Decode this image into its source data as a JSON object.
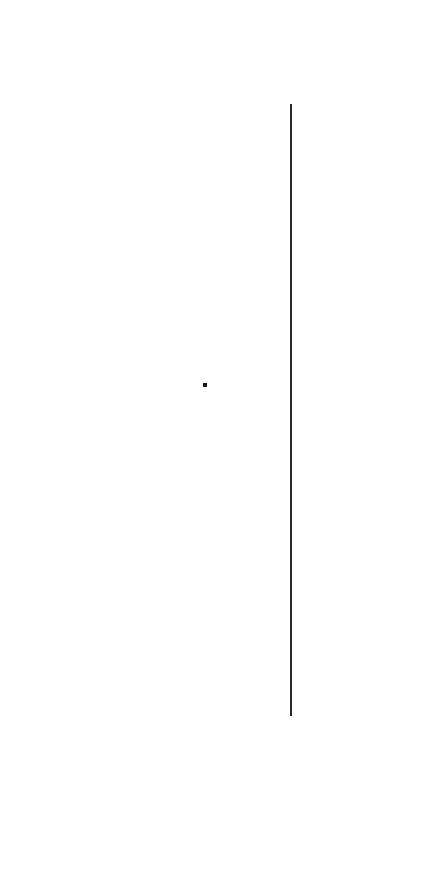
{
  "canvas": {
    "width": 427,
    "height": 879,
    "background": "#ffffff"
  },
  "elements": {
    "vertical_line": {
      "x": 290,
      "y_top": 104,
      "y_bottom": 716,
      "thickness": 2,
      "color": "#2a2a2a"
    },
    "dot": {
      "x": 203,
      "y": 383,
      "size": 4,
      "color": "#111111"
    }
  }
}
